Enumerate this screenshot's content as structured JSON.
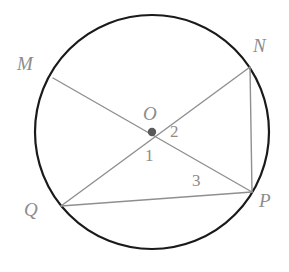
{
  "figure": {
    "type": "circle-geometry-diagram",
    "canvas": {
      "width": 289,
      "height": 272
    },
    "colors": {
      "background": "#ffffff",
      "circle_stroke": "#1a1a1a",
      "chord_stroke": "#8f8f8f",
      "center_dot": "#595959",
      "label_text": "#8c8c8c"
    },
    "circle": {
      "cx": 152,
      "cy": 132,
      "r": 117,
      "stroke_width": 2.2
    },
    "center_point": {
      "name": "O",
      "x": 152,
      "y": 132,
      "dot_radius": 4.2
    },
    "points": [
      {
        "name": "M",
        "x": 53,
        "y": 78,
        "label": "M",
        "label_x": 17,
        "label_y": 54
      },
      {
        "name": "N",
        "x": 250,
        "y": 67,
        "label": "N",
        "label_x": 253,
        "label_y": 36
      },
      {
        "name": "O",
        "x": 152,
        "y": 132,
        "label": "O",
        "label_x": 143,
        "label_y": 104
      },
      {
        "name": "Q",
        "x": 61,
        "y": 206,
        "label": "Q",
        "label_x": 24,
        "label_y": 200
      },
      {
        "name": "P",
        "x": 252,
        "y": 192,
        "label": "P",
        "label_x": 259,
        "label_y": 191
      }
    ],
    "segments": [
      {
        "name": "diameter-MP",
        "from": "M",
        "to": "P",
        "x1": 53,
        "y1": 78,
        "x2": 252,
        "y2": 192,
        "through_center": true
      },
      {
        "name": "diameter-NQ",
        "from": "N",
        "to": "Q",
        "x1": 250,
        "y1": 67,
        "x2": 61,
        "y2": 206,
        "through_center": true
      },
      {
        "name": "chord-NP",
        "from": "N",
        "to": "P",
        "x1": 250,
        "y1": 67,
        "x2": 252,
        "y2": 192,
        "through_center": false
      },
      {
        "name": "chord-QP",
        "from": "Q",
        "to": "P",
        "x1": 61,
        "y1": 206,
        "x2": 252,
        "y2": 192,
        "through_center": false
      }
    ],
    "angle_labels": [
      {
        "name": "angle-1",
        "text": "1",
        "x": 145,
        "y": 147
      },
      {
        "name": "angle-2",
        "text": "2",
        "x": 170,
        "y": 123
      },
      {
        "name": "angle-3",
        "text": "3",
        "x": 192,
        "y": 172
      }
    ]
  }
}
